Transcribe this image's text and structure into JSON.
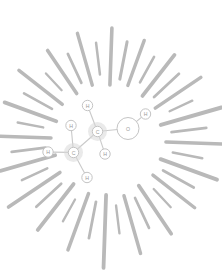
{
  "figure": {
    "background_color": "#ffffff",
    "width": 222,
    "height": 274
  },
  "palette": {
    "ray_color": "#b9b9b9",
    "bond_color": "#c9c9c9",
    "atom_outline": "#c4c4c4",
    "atom_fill": "#ffffff",
    "atom_halo": "#d8d8d8",
    "label_color": "#9a9a9a"
  },
  "burst": {
    "center_x": 108,
    "center_y": 140,
    "ray_count": 40,
    "inner_radius_min": 52,
    "inner_radius_max": 66,
    "stroke_width_min": 2.0,
    "stroke_width_max": 4.2,
    "rays": [
      {
        "angle": 272,
        "r0": 55,
        "r1": 112,
        "w": 3.6
      },
      {
        "angle": 281,
        "r0": 62,
        "r1": 100,
        "w": 3.0
      },
      {
        "angle": 290,
        "r0": 58,
        "r1": 106,
        "w": 3.4
      },
      {
        "angle": 299,
        "r0": 66,
        "r1": 95,
        "w": 2.6
      },
      {
        "angle": 308,
        "r0": 56,
        "r1": 108,
        "w": 3.8
      },
      {
        "angle": 317,
        "r0": 63,
        "r1": 97,
        "w": 2.8
      },
      {
        "angle": 326,
        "r0": 57,
        "r1": 112,
        "w": 3.5
      },
      {
        "angle": 335,
        "r0": 68,
        "r1": 93,
        "w": 2.4
      },
      {
        "angle": 344,
        "r0": 55,
        "r1": 118,
        "w": 4.0
      },
      {
        "angle": 353,
        "r0": 64,
        "r1": 99,
        "w": 2.7
      },
      {
        "angle": 2,
        "r0": 58,
        "r1": 120,
        "w": 3.6
      },
      {
        "angle": 11,
        "r0": 66,
        "r1": 96,
        "w": 2.5
      },
      {
        "angle": 20,
        "r0": 56,
        "r1": 116,
        "w": 3.9
      },
      {
        "angle": 29,
        "r0": 63,
        "r1": 98,
        "w": 2.8
      },
      {
        "angle": 38,
        "r0": 57,
        "r1": 110,
        "w": 3.4
      },
      {
        "angle": 47,
        "r0": 67,
        "r1": 92,
        "w": 2.3
      },
      {
        "angle": 56,
        "r0": 55,
        "r1": 113,
        "w": 3.7
      },
      {
        "angle": 65,
        "r0": 64,
        "r1": 97,
        "w": 2.7
      },
      {
        "angle": 74,
        "r0": 58,
        "r1": 118,
        "w": 3.5
      },
      {
        "angle": 83,
        "r0": 66,
        "r1": 94,
        "w": 2.4
      },
      {
        "angle": 92,
        "r0": 55,
        "r1": 128,
        "w": 3.8
      },
      {
        "angle": 101,
        "r0": 63,
        "r1": 100,
        "w": 2.8
      },
      {
        "angle": 110,
        "r0": 57,
        "r1": 117,
        "w": 3.5
      },
      {
        "angle": 119,
        "r0": 68,
        "r1": 93,
        "w": 2.3
      },
      {
        "angle": 128,
        "r0": 56,
        "r1": 114,
        "w": 3.9
      },
      {
        "angle": 137,
        "r0": 64,
        "r1": 98,
        "w": 2.7
      },
      {
        "angle": 146,
        "r0": 58,
        "r1": 120,
        "w": 3.6
      },
      {
        "angle": 155,
        "r0": 67,
        "r1": 95,
        "w": 2.5
      },
      {
        "angle": 164,
        "r0": 55,
        "r1": 112,
        "w": 3.7
      },
      {
        "angle": 173,
        "r0": 63,
        "r1": 97,
        "w": 2.8
      },
      {
        "angle": 182,
        "r0": 57,
        "r1": 116,
        "w": 3.4
      },
      {
        "angle": 191,
        "r0": 66,
        "r1": 92,
        "w": 2.4
      },
      {
        "angle": 200,
        "r0": 55,
        "r1": 110,
        "w": 3.8
      },
      {
        "angle": 209,
        "r0": 64,
        "r1": 96,
        "w": 2.6
      },
      {
        "angle": 218,
        "r0": 58,
        "r1": 113,
        "w": 3.5
      },
      {
        "angle": 227,
        "r0": 68,
        "r1": 91,
        "w": 2.3
      },
      {
        "angle": 236,
        "r0": 56,
        "r1": 108,
        "w": 3.6
      },
      {
        "angle": 245,
        "r0": 63,
        "r1": 95,
        "w": 2.7
      },
      {
        "angle": 254,
        "r0": 57,
        "r1": 111,
        "w": 3.4
      },
      {
        "angle": 263,
        "r0": 66,
        "r1": 98,
        "w": 2.5
      }
    ]
  },
  "molecule": {
    "name": "ethanol",
    "formula": "C2H5OH",
    "atoms": [
      {
        "id": "C1",
        "label": "C",
        "x": 73.5,
        "y": 152.5,
        "r": 5.2,
        "halo": 9.5,
        "kind": "carbon"
      },
      {
        "id": "C2",
        "label": "C",
        "x": 97.5,
        "y": 131.5,
        "r": 5.2,
        "halo": 9.5,
        "kind": "carbon"
      },
      {
        "id": "O1",
        "label": "O",
        "x": 128.0,
        "y": 128.5,
        "r": 11.0,
        "halo": 0,
        "kind": "oxygen"
      },
      {
        "id": "H1",
        "label": "H",
        "x": 87.5,
        "y": 105.5,
        "r": 5.2,
        "halo": 0,
        "kind": "hydrogen"
      },
      {
        "id": "H2",
        "label": "H",
        "x": 105.0,
        "y": 154.0,
        "r": 5.2,
        "halo": 0,
        "kind": "hydrogen"
      },
      {
        "id": "H3",
        "label": "H",
        "x": 71.0,
        "y": 125.5,
        "r": 5.2,
        "halo": 0,
        "kind": "hydrogen"
      },
      {
        "id": "H4",
        "label": "H",
        "x": 48.0,
        "y": 152.0,
        "r": 5.2,
        "halo": 0,
        "kind": "hydrogen"
      },
      {
        "id": "H5",
        "label": "H",
        "x": 87.0,
        "y": 177.5,
        "r": 5.2,
        "halo": 0,
        "kind": "hydrogen"
      },
      {
        "id": "H6",
        "label": "H",
        "x": 145.5,
        "y": 114.0,
        "r": 5.2,
        "halo": 0,
        "kind": "hydrogen"
      }
    ],
    "bonds": [
      {
        "from": "C1",
        "to": "C2",
        "order": 1
      },
      {
        "from": "C2",
        "to": "O1",
        "order": 1
      },
      {
        "from": "C2",
        "to": "H1",
        "order": 1
      },
      {
        "from": "C2",
        "to": "H2",
        "order": 1
      },
      {
        "from": "C1",
        "to": "H3",
        "order": 1
      },
      {
        "from": "C1",
        "to": "H4",
        "order": 1
      },
      {
        "from": "C1",
        "to": "H5",
        "order": 1
      },
      {
        "from": "O1",
        "to": "H6",
        "order": 1
      }
    ]
  }
}
